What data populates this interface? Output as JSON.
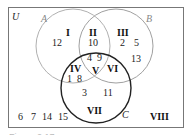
{
  "diagram": {
    "type": "venn",
    "universe_label": "U",
    "sets": [
      {
        "name": "A",
        "color": "#a0a0a0"
      },
      {
        "name": "B",
        "color": "#a0a0a0"
      },
      {
        "name": "C",
        "color": "#222222"
      }
    ],
    "regions": [
      {
        "label": "I",
        "elements": [
          "12"
        ]
      },
      {
        "label": "II",
        "elements": [
          "10"
        ]
      },
      {
        "label": "III",
        "elements": [
          "2",
          "5",
          "13"
        ]
      },
      {
        "label": "IV",
        "elements": [
          "1",
          "8"
        ]
      },
      {
        "label": "V",
        "elements": [
          "4",
          "9"
        ]
      },
      {
        "label": "VI",
        "elements": []
      },
      {
        "label": "VII",
        "elements": [
          "3",
          "11"
        ]
      },
      {
        "label": "VIII",
        "elements": [
          "6",
          "7",
          "14",
          "15"
        ]
      }
    ],
    "caption_partial": "Figure 2.17"
  }
}
